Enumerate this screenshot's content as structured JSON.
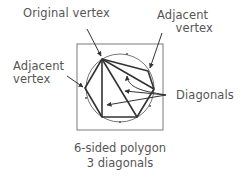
{
  "labels": {
    "original_vertex": "Original vertex",
    "adjacent_vertex_right": [
      "Adjacent",
      "vertex"
    ],
    "adjacent_vertex_left": [
      "Adjacent",
      "vertex"
    ],
    "diagonals": "Diagonals"
  },
  "caption": {
    "line1": "6-sided polygon",
    "line2": "3 diagonals"
  },
  "colors": {
    "stroke": "#333333",
    "frame": "#7a7a7a",
    "text": "#555555",
    "background": "#ffffff"
  },
  "polygon": {
    "sides": 6,
    "diagonal_count": 3
  }
}
